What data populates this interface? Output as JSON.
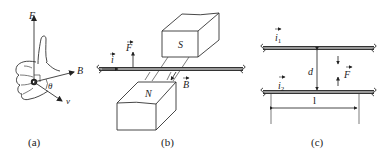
{
  "figure": {
    "panels": [
      {
        "id": "a",
        "caption": "(a)",
        "description": "Right-hand rule: thumb points along F, fingers curl from v to B",
        "labels": {
          "force": "F",
          "field": "B",
          "velocity": "v",
          "angle": "θ"
        }
      },
      {
        "id": "b",
        "caption": "(b)",
        "description": "Current-carrying wire between N and S magnet poles",
        "labels": {
          "current": "i",
          "force": "F",
          "field": "B",
          "north_pole": "N",
          "south_pole": "S"
        }
      },
      {
        "id": "c",
        "caption": "(c)",
        "description": "Two parallel current-carrying wires separated by distance d over length l",
        "labels": {
          "current_1": "i",
          "current_1_sub": "1",
          "current_2": "i",
          "current_2_sub": "2",
          "separation": "d",
          "force": "F",
          "length": "l"
        }
      }
    ],
    "colors": {
      "ink": "#333333",
      "wire_core": "#bdbdbd",
      "background": "#ffffff"
    }
  }
}
